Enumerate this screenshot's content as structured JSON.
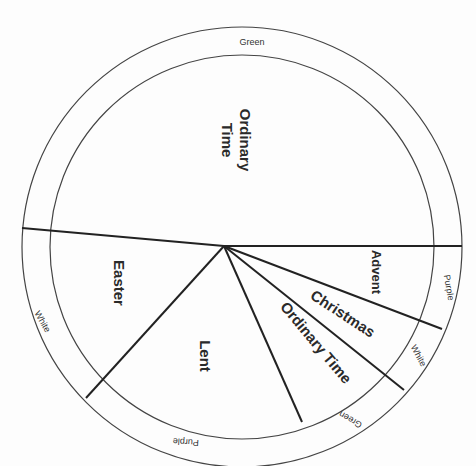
{
  "diagram": {
    "type": "liturgical-year-wheel",
    "geometry": {
      "center": [
        242,
        247
      ],
      "outer_radius": 220,
      "inner_radius": 192,
      "hub": [
        224,
        246
      ]
    },
    "seasons": [
      {
        "name": "Ordinary Time",
        "label_line1": "Ordinary",
        "label_line2": "Time",
        "color": "Green",
        "position": "top"
      },
      {
        "name": "Advent",
        "label": "Advent",
        "color": "Purple",
        "position": "right"
      },
      {
        "name": "Christmas",
        "label": "Christmas",
        "color": "White",
        "position": "lower-right"
      },
      {
        "name": "Ordinary Time",
        "label": "Ordinary Time",
        "color": "Green",
        "position": "lower-right"
      },
      {
        "name": "Lent",
        "label": "Lent",
        "color": "Purple",
        "position": "bottom"
      },
      {
        "name": "Easter",
        "label": "Easter",
        "color": "White",
        "position": "left"
      }
    ],
    "color_labels": {
      "top": "Green",
      "advent": "Purple",
      "christmas": "White",
      "ordinary_lower": "Green",
      "lent": "Purple",
      "easter": "White"
    },
    "labels": {
      "ordinary_top_1": "Ordinary",
      "ordinary_top_2": "Time",
      "advent": "Advent",
      "christmas": "Christmas",
      "ordinary_lower": "Ordinary Time",
      "lent": "Lent",
      "easter": "Easter"
    }
  }
}
